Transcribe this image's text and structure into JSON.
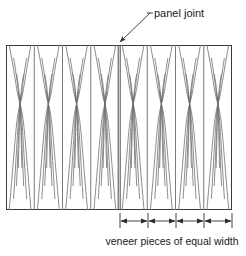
{
  "figure": {
    "background_color": "#ffffff",
    "line_color": "#3a3a3a",
    "grain_color": "#6e6e6e",
    "text_color": "#1a1a1a"
  },
  "annotations": {
    "panel_joint_label": "panel joint",
    "caption": "veneer pieces of equal width"
  },
  "panel": {
    "left": 6,
    "right": 232,
    "top": 45,
    "bottom": 210,
    "veneer_piece_count": 8,
    "pieces_per_panel": 4,
    "panel_joint_x": 119,
    "seam_positions": [
      6,
      34.25,
      62.5,
      90.75,
      119,
      147.25,
      175.5,
      203.75,
      232
    ]
  },
  "leader": {
    "text_anchor_x": 150,
    "text_anchor_y": 13,
    "tip_x": 120,
    "tip_y": 44
  },
  "dimension": {
    "y_line": 218,
    "tick_top": 213,
    "tick_bottom": 228,
    "segments": 4,
    "tick_positions": [
      120,
      148,
      176,
      204,
      232
    ],
    "caption_x": 172,
    "caption_y": 244
  }
}
